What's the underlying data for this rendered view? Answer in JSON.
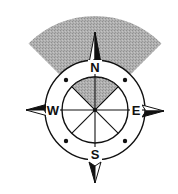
{
  "diagram": {
    "type": "compass-rose",
    "colors": {
      "background": "#ffffff",
      "stroke": "#111111",
      "sector_fill": "#a9a9a9",
      "arrow_dark": "#111111",
      "arrow_light": "#ffffff"
    },
    "geometry": {
      "center": [
        95,
        110
      ],
      "outer_ring_radius": 50,
      "inner_ring_radius": 33,
      "sector_outer_radius": 94,
      "sector_half_angle_deg": 45
    },
    "labels": {
      "north": "N",
      "south": "S",
      "east": "E",
      "west": "W"
    }
  }
}
